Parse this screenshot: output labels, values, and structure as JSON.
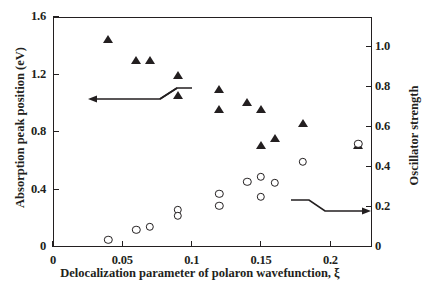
{
  "chart_data": {
    "type": "scatter",
    "title": "",
    "xlabel": "Delocalization parameter of polaron wavefunction, ξ",
    "ylabel": "Absorption peak position (eV)",
    "ylabel_right": "Oscillator strength",
    "xlim": [
      0,
      0.23
    ],
    "ylim": [
      0,
      1.6
    ],
    "ylim_right": [
      0,
      1.15
    ],
    "xticks": [
      "0",
      "0.05",
      "0.1",
      "0.15",
      "0.2"
    ],
    "xtick_values": [
      0,
      0.05,
      0.1,
      0.15,
      0.2
    ],
    "yticks_left": [
      "0",
      "0.4",
      "0.8",
      "1.2",
      "1.6"
    ],
    "ytick_values_left": [
      0,
      0.4,
      0.8,
      1.2,
      1.6
    ],
    "yticks_right": [
      "0",
      "0.2",
      "0.4",
      "0.6",
      "0.8",
      "1.0"
    ],
    "ytick_values_right": [
      0,
      0.2,
      0.4,
      0.6,
      0.8,
      1.0
    ],
    "grid": false,
    "legend": "none",
    "series": [
      {
        "name": "Absorption peak position",
        "marker": "filled-triangle",
        "axis": "left",
        "color": "#231f20",
        "points": [
          {
            "x": 0.04,
            "y": 1.45
          },
          {
            "x": 0.06,
            "y": 1.3
          },
          {
            "x": 0.07,
            "y": 1.3
          },
          {
            "x": 0.09,
            "y": 1.2
          },
          {
            "x": 0.09,
            "y": 1.06
          },
          {
            "x": 0.12,
            "y": 1.1
          },
          {
            "x": 0.12,
            "y": 0.96
          },
          {
            "x": 0.14,
            "y": 1.01
          },
          {
            "x": 0.15,
            "y": 0.96
          },
          {
            "x": 0.15,
            "y": 0.71
          },
          {
            "x": 0.16,
            "y": 0.76
          },
          {
            "x": 0.18,
            "y": 0.86
          },
          {
            "x": 0.22,
            "y": 0.71
          }
        ]
      },
      {
        "name": "Oscillator strength",
        "marker": "open-circle",
        "axis": "right",
        "color": "#231f20",
        "points": [
          {
            "x": 0.04,
            "y": 0.035
          },
          {
            "x": 0.06,
            "y": 0.085
          },
          {
            "x": 0.07,
            "y": 0.1
          },
          {
            "x": 0.09,
            "y": 0.185
          },
          {
            "x": 0.09,
            "y": 0.155
          },
          {
            "x": 0.12,
            "y": 0.265
          },
          {
            "x": 0.12,
            "y": 0.205
          },
          {
            "x": 0.14,
            "y": 0.325
          },
          {
            "x": 0.15,
            "y": 0.35
          },
          {
            "x": 0.15,
            "y": 0.25
          },
          {
            "x": 0.16,
            "y": 0.32
          },
          {
            "x": 0.18,
            "y": 0.425
          },
          {
            "x": 0.22,
            "y": 0.515
          }
        ]
      }
    ],
    "annotations": [
      {
        "name": "left-axis-pointer-arrow",
        "direction": "left",
        "description": "arrow with zigzag break pointing to left axis"
      },
      {
        "name": "right-axis-pointer-arrow",
        "direction": "right",
        "description": "arrow with zigzag break pointing to right axis"
      }
    ]
  }
}
